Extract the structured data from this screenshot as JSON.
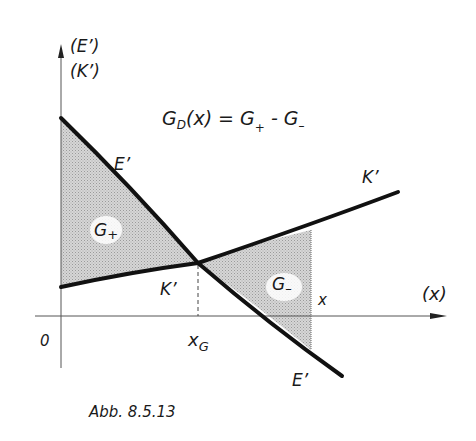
{
  "figure": {
    "caption": "Abb. 8.5.13",
    "formula": {
      "lhs_main": "G",
      "lhs_sub": "D",
      "lhs_arg": "(x) = ",
      "rhs_g1": "G",
      "rhs_sub1": "+",
      "rhs_minus": " - ",
      "rhs_g2": "G",
      "rhs_sub2": "–"
    },
    "y_axis": {
      "label_top": "(E’)",
      "label_bottom": "(K’)"
    },
    "x_axis": {
      "label": "(x)",
      "origin": "0"
    },
    "curves": {
      "E_label_upper": "E’",
      "E_label_lower": "E’",
      "K_label_upper": "K’",
      "K_label_lower": "K’"
    },
    "areas": {
      "G_plus": {
        "main": "G",
        "sub": "+"
      },
      "G_minus": {
        "main": "G",
        "sub": "–"
      }
    },
    "markers": {
      "x_G_main": "x",
      "x_G_sub": "G",
      "x_label": "x"
    },
    "colors": {
      "ink": "#111111",
      "shade": "#c8c8c8",
      "axis": "#555555",
      "background": "#ffffff"
    }
  }
}
